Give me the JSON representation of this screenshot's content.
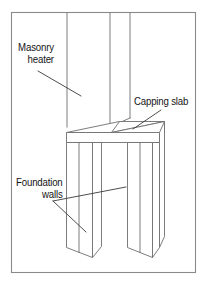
{
  "figure": {
    "background_color": "#ffffff",
    "frame": {
      "stroke_color": "#8a8a8a",
      "x": 11,
      "y": 12,
      "width": 185,
      "height": 261
    },
    "line_color": "#6e6e6e",
    "leader_color": "#3a3a3a",
    "text_color": "#141414"
  },
  "callouts": {
    "masonry_heater": {
      "line1": "Masonry",
      "line2": "heater"
    },
    "capping_slab": {
      "line1": "Capping slab"
    },
    "foundation_walls": {
      "line1": "Foundation",
      "line2": "walls"
    }
  },
  "drawing": {
    "heater_label": "masonry heater shaft",
    "slab_label": "capping slab",
    "wall_left_label": "foundation wall left",
    "wall_right_label": "foundation wall right"
  }
}
